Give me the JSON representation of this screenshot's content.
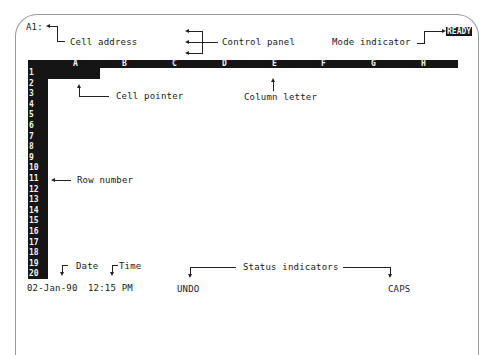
{
  "screen": {
    "cell_address": "A1:",
    "mode_indicator": "READY",
    "columns": [
      "A",
      "B",
      "C",
      "D",
      "E",
      "F",
      "G",
      "H"
    ],
    "rows": [
      "1",
      "2",
      "3",
      "4",
      "5",
      "6",
      "7",
      "8",
      "9",
      "10",
      "11",
      "12",
      "13",
      "14",
      "15",
      "16",
      "17",
      "18",
      "19",
      "20"
    ],
    "status_bar": {
      "date": "02-Jan-90",
      "time": "12:15 PM",
      "indicators": [
        "UNDO",
        "CAPS"
      ]
    }
  },
  "callouts": {
    "cell_address": "Cell address",
    "control_panel": "Control panel",
    "mode_indicator": "Mode indicator",
    "cell_pointer": "Cell pointer",
    "column_letter": "Column letter",
    "row_number": "Row number",
    "date": "Date",
    "time": "Time",
    "status_indicators": "Status indicators"
  }
}
